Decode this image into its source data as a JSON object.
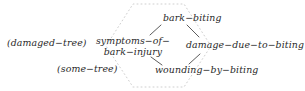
{
  "diagram": {
    "type": "semantic-network",
    "background_color": "#ffffff",
    "text_color": "#2a2a2a",
    "edge_color": "#555555",
    "boundary_color": "#cfcfcf",
    "nodes": [
      {
        "id": "damaged-tree",
        "label": "(damaged−tree)",
        "x": 7,
        "y": 38,
        "lines": [
          "(damaged−tree)"
        ]
      },
      {
        "id": "some-tree",
        "label": "(some−tree)",
        "x": 57,
        "y": 64,
        "lines": [
          "(some−tree)"
        ]
      },
      {
        "id": "symptoms",
        "label": "symptoms−of−bark−injury",
        "x": 95,
        "y": 36,
        "lines": [
          "symptoms−of−",
          "bark−injury"
        ]
      },
      {
        "id": "bark-biting",
        "label": "bark−biting",
        "x": 163,
        "y": 13,
        "lines": [
          "bark−biting"
        ]
      },
      {
        "id": "damage-due",
        "label": "damage−due−to−biting",
        "x": 186,
        "y": 40,
        "lines": [
          "damage−due−to−biting"
        ]
      },
      {
        "id": "wounding",
        "label": "wounding−by−biting",
        "x": 155,
        "y": 65,
        "lines": [
          "wounding−by−biting"
        ]
      }
    ],
    "edges": [
      {
        "from": "bark-biting",
        "to": "symptoms",
        "style": "solid"
      },
      {
        "from": "bark-biting",
        "to": "damage-due",
        "style": "solid"
      },
      {
        "from": "symptoms",
        "to": "wounding",
        "style": "solid"
      },
      {
        "from": "damage-due",
        "to": "wounding",
        "style": "solid"
      }
    ],
    "boundary": {
      "style": "dotted",
      "shape": "hexagon",
      "description": "faint dotted hexagonal region enclosing the central cluster"
    }
  }
}
